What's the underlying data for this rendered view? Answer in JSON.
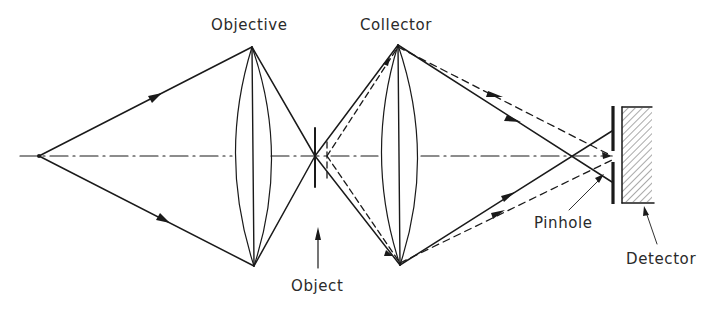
{
  "labels": {
    "objective": "Objective",
    "collector": "Collector",
    "object": "Object",
    "pinhole": "Pinhole",
    "detector": "Detector"
  },
  "diagram": {
    "type": "confocal-optical-path",
    "components": [
      "Objective",
      "Object",
      "Collector",
      "Pinhole",
      "Detector"
    ],
    "line_color": "#1a1a1a",
    "text_color": "#2a2a2a",
    "background": "#ffffff"
  }
}
